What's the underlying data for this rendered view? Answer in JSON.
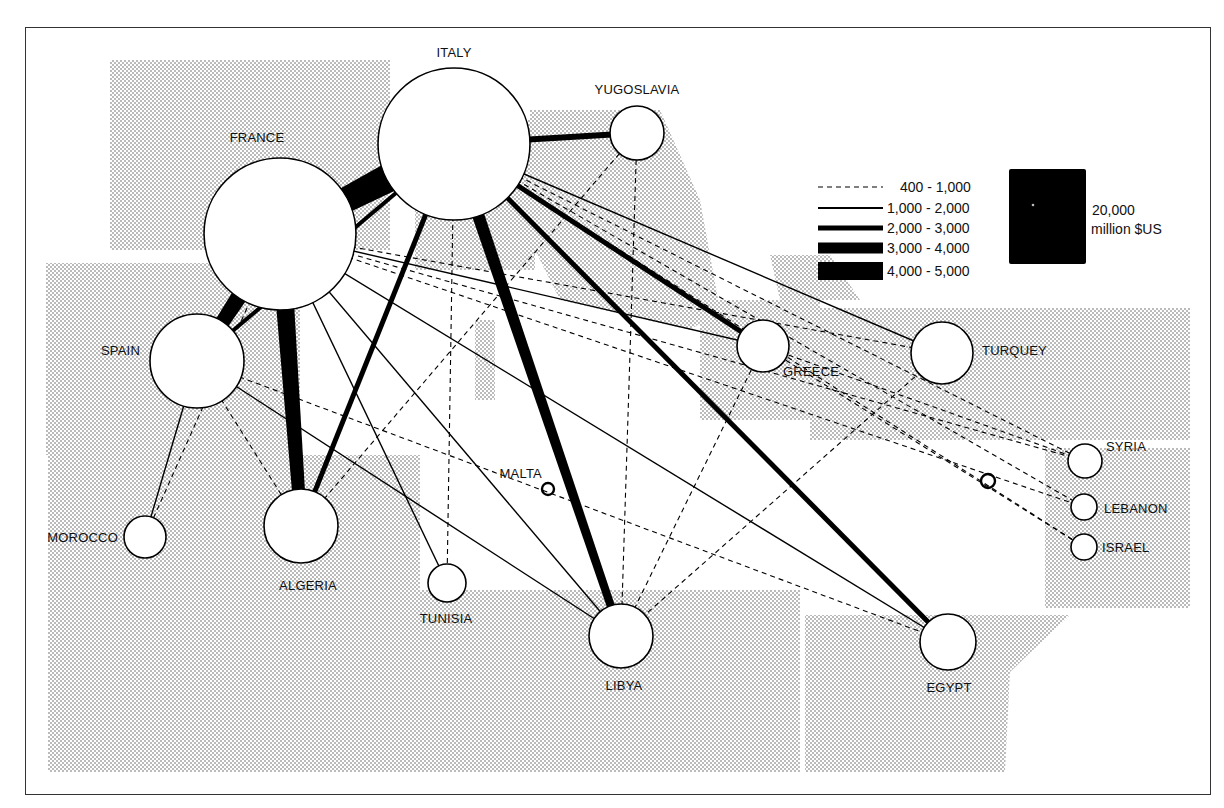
{
  "legend": {
    "items": [
      {
        "label": "400 - 1,000",
        "width": 1.2,
        "dash": true
      },
      {
        "label": "1,000 - 2,000",
        "width": 2,
        "dash": false
      },
      {
        "label": "2,000 - 3,000",
        "width": 5,
        "dash": false
      },
      {
        "label": "3,000 - 4,000",
        "width": 11,
        "dash": false
      },
      {
        "label": "4,000 - 5,000",
        "width": 18,
        "dash": false
      }
    ],
    "scale_value": "20,000",
    "scale_unit": "million $US"
  },
  "nodes": [
    {
      "id": "italy",
      "label": "ITALY",
      "x": 454,
      "y": 144,
      "r": 76,
      "lx": 454,
      "ly": 57,
      "anchor": "middle"
    },
    {
      "id": "france",
      "label": "FRANCE",
      "x": 280,
      "y": 234,
      "r": 76,
      "lx": 257,
      "ly": 142,
      "anchor": "middle"
    },
    {
      "id": "yugoslavia",
      "label": "YUGOSLAVIA",
      "x": 637,
      "y": 133,
      "r": 27,
      "lx": 637,
      "ly": 94,
      "anchor": "middle"
    },
    {
      "id": "spain",
      "label": "SPAIN",
      "x": 197,
      "y": 361,
      "r": 47,
      "lx": 140,
      "ly": 355,
      "anchor": "end"
    },
    {
      "id": "greece",
      "label": "GREECE",
      "x": 763,
      "y": 346,
      "r": 26,
      "lx": 783,
      "ly": 376,
      "anchor": "start"
    },
    {
      "id": "turquey",
      "label": "TURQUEY",
      "x": 942,
      "y": 353,
      "r": 31,
      "lx": 982,
      "ly": 355,
      "anchor": "start"
    },
    {
      "id": "syria",
      "label": "SYRIA",
      "x": 1085,
      "y": 461,
      "r": 17,
      "lx": 1106,
      "ly": 451,
      "anchor": "start"
    },
    {
      "id": "lebanon",
      "label": "LEBANON",
      "x": 1084,
      "y": 507,
      "r": 13,
      "lx": 1104,
      "ly": 513,
      "anchor": "start"
    },
    {
      "id": "israel",
      "label": "ISRAEL",
      "x": 1084,
      "y": 547,
      "r": 13,
      "lx": 1102,
      "ly": 552,
      "anchor": "start"
    },
    {
      "id": "malta",
      "label": "MALTA",
      "x": 548,
      "y": 489,
      "r": 6,
      "lx": 542,
      "ly": 478,
      "anchor": "end"
    },
    {
      "id": "cyprus",
      "label": "",
      "x": 988,
      "y": 481,
      "r": 7,
      "lx": 0,
      "ly": 0,
      "anchor": "start"
    },
    {
      "id": "morocco",
      "label": "MOROCCO",
      "x": 145,
      "y": 537,
      "r": 21,
      "lx": 118,
      "ly": 542,
      "anchor": "end"
    },
    {
      "id": "algeria",
      "label": "ALGERIA",
      "x": 301,
      "y": 526,
      "r": 37,
      "lx": 308,
      "ly": 590,
      "anchor": "middle"
    },
    {
      "id": "tunisia",
      "label": "TUNISIA",
      "x": 447,
      "y": 583,
      "r": 19,
      "lx": 446,
      "ly": 623,
      "anchor": "middle"
    },
    {
      "id": "libya",
      "label": "LIBYA",
      "x": 621,
      "y": 636,
      "r": 32,
      "lx": 624,
      "ly": 690,
      "anchor": "middle"
    },
    {
      "id": "egypt",
      "label": "EGYPT",
      "x": 948,
      "y": 642,
      "r": 28,
      "lx": 949,
      "ly": 692,
      "anchor": "middle"
    }
  ],
  "flows": [
    {
      "from": "italy",
      "to": "france",
      "class": "4,000 - 5,000",
      "w": 34
    },
    {
      "from": "france",
      "to": "spain",
      "class": "4,000 - 5,000",
      "w": 20
    },
    {
      "from": "france",
      "to": "algeria",
      "class": "4,000 - 5,000",
      "w": 20
    },
    {
      "from": "italy",
      "to": "libya",
      "class": "3,000 - 4,000",
      "w": 13
    },
    {
      "from": "italy",
      "to": "yugoslavia",
      "class": "2,000 - 3,000",
      "w": 6
    },
    {
      "from": "italy",
      "to": "algeria",
      "class": "2,000 - 3,000",
      "w": 5
    },
    {
      "from": "italy",
      "to": "greece",
      "class": "2,000 - 3,000",
      "w": 5
    },
    {
      "from": "italy",
      "to": "egypt",
      "class": "2,000 - 3,000",
      "w": 5
    },
    {
      "from": "italy",
      "to": "spain",
      "class": "2,000 - 3,000",
      "w": 4
    },
    {
      "from": "italy",
      "to": "turquey",
      "class": "1,000 - 2,000",
      "w": 1.4
    },
    {
      "from": "france",
      "to": "greece",
      "class": "1,000 - 2,000",
      "w": 1.4
    },
    {
      "from": "france",
      "to": "tunisia",
      "class": "1,000 - 2,000",
      "w": 1.4
    },
    {
      "from": "france",
      "to": "libya",
      "class": "1,000 - 2,000",
      "w": 1.4
    },
    {
      "from": "france",
      "to": "egypt",
      "class": "1,000 - 2,000",
      "w": 1.4
    },
    {
      "from": "spain",
      "to": "morocco",
      "class": "1,000 - 2,000",
      "w": 1.4
    },
    {
      "from": "spain",
      "to": "libya",
      "class": "1,000 - 2,000",
      "w": 1.4
    },
    {
      "from": "italy",
      "to": "tunisia",
      "class": "400 - 1,000",
      "w": 1.1,
      "dash": true
    },
    {
      "from": "italy",
      "to": "syria",
      "class": "400 - 1,000",
      "w": 1.1,
      "dash": true
    },
    {
      "from": "italy",
      "to": "lebanon",
      "class": "400 - 1,000",
      "w": 1.1,
      "dash": true
    },
    {
      "from": "italy",
      "to": "israel",
      "class": "400 - 1,000",
      "w": 1.1,
      "dash": true
    },
    {
      "from": "france",
      "to": "turquey",
      "class": "400 - 1,000",
      "w": 1.1,
      "dash": true
    },
    {
      "from": "france",
      "to": "syria",
      "class": "400 - 1,000",
      "w": 1.1,
      "dash": true
    },
    {
      "from": "france",
      "to": "lebanon",
      "class": "400 - 1,000",
      "w": 1.1,
      "dash": true
    },
    {
      "from": "france",
      "to": "morocco",
      "class": "400 - 1,000",
      "w": 1.1,
      "dash": true
    },
    {
      "from": "yugoslavia",
      "to": "algeria",
      "class": "400 - 1,000",
      "w": 1.1,
      "dash": true
    },
    {
      "from": "yugoslavia",
      "to": "libya",
      "class": "400 - 1,000",
      "w": 1.1,
      "dash": true
    },
    {
      "from": "yugoslavia",
      "to": "italy",
      "class": "400 - 1,000",
      "w": 1.1,
      "dash": true
    },
    {
      "from": "spain",
      "to": "algeria",
      "class": "400 - 1,000",
      "w": 1.1,
      "dash": true
    },
    {
      "from": "spain",
      "to": "egypt",
      "class": "400 - 1,000",
      "w": 1.1,
      "dash": true
    },
    {
      "from": "greece",
      "to": "libya",
      "class": "400 - 1,000",
      "w": 1.1,
      "dash": true
    },
    {
      "from": "greece",
      "to": "syria",
      "class": "400 - 1,000",
      "w": 1.1,
      "dash": true
    },
    {
      "from": "turquey",
      "to": "libya",
      "class": "400 - 1,000",
      "w": 1.1,
      "dash": true
    },
    {
      "from": "greece",
      "to": "israel",
      "class": "400 - 1,000",
      "w": 1.1,
      "dash": true
    }
  ],
  "land": [
    "M110,60 L390,60 L390,250 L110,250 Z",
    "M46,263 L300,263 L300,455 L46,455 Z",
    "M48,455 L420,455 L420,772 L48,772 Z",
    "M415,120 L535,120 L535,270 L415,270 Z",
    "M530,110 L660,110 L700,200 L720,310 L690,330 L560,300 L530,240 Z",
    "M700,300 L820,300 L820,420 L700,420 Z",
    "M810,308 L1190,308 L1190,440 L810,440 Z",
    "M1045,448 L1190,448 L1190,608 L1045,608 Z",
    "M420,590 L800,590 L800,772 L420,772 Z",
    "M805,615 L1070,615 L1010,672 L1005,772 L805,772 Z",
    "M770,255 L830,255 L860,300 L780,300 Z",
    "M475,320 L495,320 L495,400 L475,400 Z"
  ]
}
